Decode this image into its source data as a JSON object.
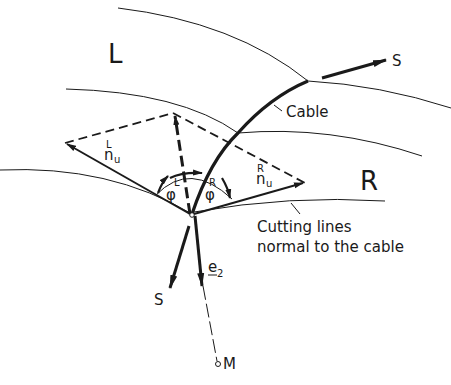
{
  "figure": {
    "regions": {
      "left": "L",
      "right": "R"
    },
    "labels": {
      "cable": "Cable",
      "force_top": "S",
      "force_bottom": "S",
      "cutting_lines_1": "Cutting lines",
      "cutting_lines_2": "normal to the cable",
      "left_normal_sup": "L",
      "left_normal_base": "n",
      "left_normal_sub": "u",
      "right_normal_sup": "R",
      "right_normal_base": "n",
      "right_normal_sub": "u",
      "left_angle_sup": "L",
      "left_angle": "φ",
      "right_angle_sup": "R",
      "right_angle": "φ",
      "unit_vector_base": "e",
      "unit_vector_sub": "2",
      "center_point": "M"
    },
    "colors": {
      "ink": "#1a1a1a",
      "background": "#ffffff"
    }
  }
}
